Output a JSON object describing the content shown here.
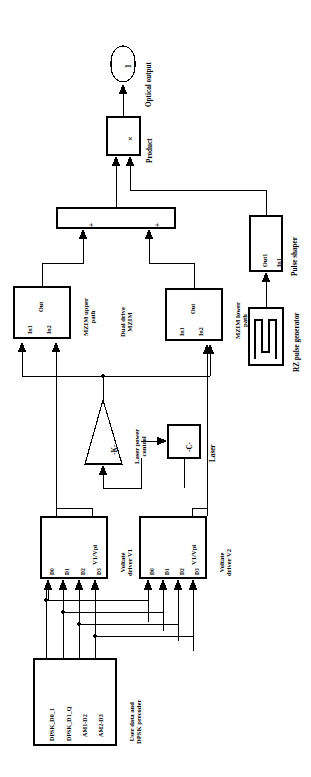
{
  "figure": {
    "orientation": "rotated-90-ccw",
    "line_color": "#000000",
    "fill_color": "#ffffff",
    "width": 311,
    "height": 777
  },
  "blocks": {
    "optical_output": {
      "label": "Optical output",
      "inner": "1",
      "shape": "rounded-terminator"
    },
    "product": {
      "label": "Product",
      "inner": "×",
      "shape": "rect"
    },
    "sum_bar": {
      "label": "",
      "port_a": "+",
      "port_b": "+",
      "shape": "wide-bar"
    },
    "pulse_shaper": {
      "label": "Pulse shaper",
      "port_in": "In1",
      "port_out": "Out1",
      "shape": "rect"
    },
    "rz_pulse_generator": {
      "label": "RZ pulse generator",
      "inner": "pulse-waveform-icon",
      "shape": "rect"
    },
    "mzim_upper": {
      "label": "MZIM upper\npath",
      "label_line1": "MZIM upper",
      "label_line2": "path",
      "port_in1": "In1",
      "port_in2": "In2",
      "port_out": "Out",
      "shape": "rect"
    },
    "mzim_lower": {
      "label": "MZIM lower\npath",
      "label_line1": "MZIM lower",
      "label_line2": "path",
      "port_in1": "In1",
      "port_in2": "In2",
      "port_out": "Out",
      "shape": "rect"
    },
    "dual_drive_mzim": {
      "label_line1": "Dual drive",
      "label_line2": "MZIM"
    },
    "laser_power_control": {
      "label_line1": "Laser power",
      "label_line2": "control",
      "inner": "-K-",
      "shape": "triangle-gain"
    },
    "laser": {
      "label": "Laser",
      "inner": "-C-",
      "shape": "rect"
    },
    "voltage_driver_v1": {
      "label_line1": "Voltate",
      "label_line2": "driver V1",
      "gain_label": "V1/Vpi",
      "ports": [
        "D0",
        "D1",
        "D2",
        "D3"
      ],
      "shape": "rect"
    },
    "voltage_driver_v2": {
      "label_line1": "Voltate",
      "label_line2": "driver V2",
      "gain_label": "V1/Vpi",
      "ports": [
        "D0",
        "D1",
        "D2",
        "D3"
      ],
      "shape": "rect"
    },
    "precoder": {
      "label_line1": "User data and",
      "label_line2": "DPSK precoder",
      "ports": [
        "DPSK_D0_1",
        "DPSK_D1_Q",
        "AM1-D2",
        "AM2-D3"
      ],
      "shape": "rect"
    }
  }
}
